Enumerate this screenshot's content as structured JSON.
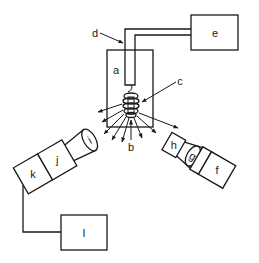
{
  "diagram": {
    "type": "apparatus-schematic",
    "labels": {
      "a": "a",
      "b": "b",
      "c": "c",
      "d": "d",
      "e": "e",
      "f": "f",
      "g": "g",
      "h": "h",
      "i": "i",
      "j": "j",
      "k": "k",
      "l": "l"
    },
    "components": [
      {
        "id": "a",
        "shape": "rectangle",
        "description": "central chamber/cell"
      },
      {
        "id": "b",
        "shape": "arrow-label",
        "description": "point at bottom of coil"
      },
      {
        "id": "c",
        "shape": "coil",
        "description": "helical coil inside chamber"
      },
      {
        "id": "d",
        "shape": "tube",
        "description": "L-shaped tube connecting chamber to e"
      },
      {
        "id": "e",
        "shape": "rectangle",
        "description": "unit connected via tube d"
      },
      {
        "id": "f",
        "shape": "rectangle",
        "description": "right-arm end unit"
      },
      {
        "id": "g",
        "shape": "lens",
        "description": "right-arm lens"
      },
      {
        "id": "h",
        "shape": "rectangle",
        "description": "right-arm element near chamber"
      },
      {
        "id": "i",
        "shape": "lens",
        "description": "left-arm lens"
      },
      {
        "id": "j",
        "shape": "rectangle",
        "description": "left-arm unit"
      },
      {
        "id": "k",
        "shape": "rectangle",
        "description": "left-arm end unit"
      },
      {
        "id": "l",
        "shape": "rectangle",
        "description": "unit connected by wire to k"
      }
    ],
    "connections": [
      {
        "from": "e",
        "to": "c",
        "via": "d"
      },
      {
        "from": "k",
        "to": "l",
        "via": "wire"
      }
    ],
    "colors": {
      "stroke": "#1a1a1a",
      "background": "#ffffff"
    }
  }
}
